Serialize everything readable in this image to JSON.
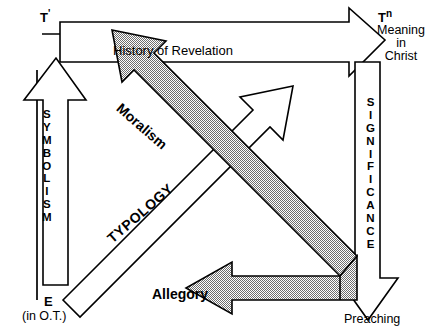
{
  "diagram": {
    "background_color": "#ffffff",
    "line_color": "#000000",
    "shaded_fill_color": "#a0a0a0",
    "nodes": {
      "top_left": {
        "symbol": "T",
        "superscript": "'",
        "full": "T'"
      },
      "top_right": {
        "symbol": "T",
        "superscript": "n",
        "full": "Tⁿ",
        "caption": "Meaning\nin\nChrist"
      },
      "bottom_left": {
        "symbol": "E",
        "caption": "(in O.T.)"
      },
      "bottom_right": {
        "caption": "Preaching"
      }
    },
    "arrows": [
      {
        "name": "history-of-revelation",
        "label": "History of Revelation",
        "style": "outline",
        "direction": "left-to-right",
        "from": "T'",
        "to": "Tⁿ"
      },
      {
        "name": "symbolism",
        "label": "SYMBOLISM",
        "letters": [
          "S",
          "Y",
          "M",
          "B",
          "O",
          "L",
          "I",
          "S",
          "M"
        ],
        "style": "outline",
        "direction": "bottom-to-top",
        "from": "E",
        "to": "T'"
      },
      {
        "name": "significance",
        "label": "SIGNIFICANCE",
        "letters": [
          "S",
          "I",
          "G",
          "N",
          "I",
          "F",
          "I",
          "C",
          "A",
          "N",
          "C",
          "E"
        ],
        "style": "outline",
        "direction": "top-to-bottom",
        "from": "Tⁿ",
        "to": "Preaching"
      },
      {
        "name": "typology",
        "label": "TYPOLOGY",
        "style": "outline",
        "direction": "diagonal-up-right",
        "from": "E",
        "to": "Tⁿ"
      },
      {
        "name": "moralism",
        "label": "Moralism",
        "style": "shaded",
        "direction": "diagonal-up-left",
        "from": "Preaching",
        "to": "T'"
      },
      {
        "name": "allegory",
        "label": "Allegory",
        "style": "shaded",
        "direction": "right-to-left",
        "from": "Preaching",
        "to": "E"
      }
    ]
  }
}
